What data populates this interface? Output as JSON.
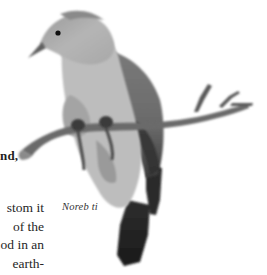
{
  "page": {
    "heading_fragment": "nd,",
    "body_lines": [
      "stom it",
      "of the",
      "od in an",
      "earth-"
    ],
    "caption": "Noreb ti"
  },
  "illustration": {
    "subject": "pigeon perched on branch",
    "colors": {
      "head": "#8e8e8e",
      "breast": "#b9b9b9",
      "wing": "#6f6f6f",
      "tail": "#222222",
      "branch": "#5a5a5a",
      "eye": "#111111"
    }
  }
}
